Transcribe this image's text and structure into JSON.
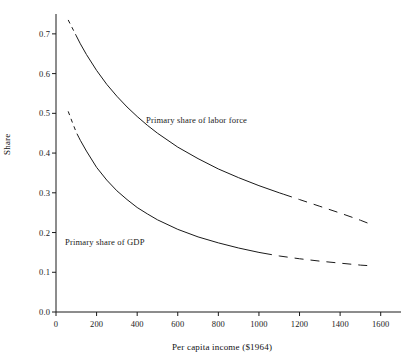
{
  "chart_data": {
    "type": "line",
    "title": "",
    "xlabel": "Per capita income ($1964)",
    "ylabel": "Share",
    "xlim": [
      0,
      1700
    ],
    "ylim": [
      0.0,
      0.75
    ],
    "grid": false,
    "legend_position": "inline-annotations",
    "xticks": [
      0,
      200,
      400,
      600,
      800,
      1000,
      1200,
      1400,
      1600
    ],
    "xtick_labels": [
      "0",
      "200",
      "400",
      "600",
      "800",
      "1000",
      "1200",
      "1400",
      "1600"
    ],
    "yticks": [
      0.0,
      0.1,
      0.2,
      0.3,
      0.4,
      0.5,
      0.6,
      0.7
    ],
    "ytick_labels": [
      "0.0",
      "0.1",
      "0.2",
      "0.3",
      "0.4",
      "0.5",
      "0.6",
      "0.7"
    ],
    "line_color": "#1a1a1a",
    "series": [
      {
        "name": "Primary share of labor force",
        "annotation": "Primary share of labor force",
        "style": "dashed-then-solid-then-dashed",
        "x": [
          60,
          80,
          100,
          120,
          150,
          200,
          250,
          300,
          350,
          400,
          450,
          500,
          600,
          700,
          800,
          900,
          1000,
          1100,
          1200,
          1300,
          1400,
          1500,
          1550
        ],
        "values": [
          0.735,
          0.715,
          0.695,
          0.675,
          0.648,
          0.608,
          0.573,
          0.543,
          0.516,
          0.492,
          0.47,
          0.45,
          0.415,
          0.386,
          0.36,
          0.338,
          0.318,
          0.3,
          0.283,
          0.266,
          0.249,
          0.231,
          0.221
        ],
        "solid_from": 100,
        "solid_to": 1120
      },
      {
        "name": "Primary share of GDP",
        "annotation": "Primary share of GDP",
        "style": "dashed-then-solid-then-dashed",
        "x": [
          60,
          80,
          100,
          120,
          150,
          200,
          250,
          300,
          350,
          400,
          450,
          500,
          600,
          700,
          800,
          900,
          1000,
          1100,
          1200,
          1300,
          1400,
          1500,
          1560
        ],
        "values": [
          0.505,
          0.478,
          0.452,
          0.432,
          0.405,
          0.364,
          0.332,
          0.305,
          0.283,
          0.263,
          0.247,
          0.232,
          0.208,
          0.189,
          0.174,
          0.161,
          0.15,
          0.141,
          0.134,
          0.128,
          0.123,
          0.118,
          0.116
        ],
        "solid_from": 112,
        "solid_to": 1020
      }
    ]
  },
  "annotations": {
    "labor_force": "Primary share of labor force",
    "gdp": "Primary share of GDP"
  },
  "axes": {
    "y_title": "Share",
    "x_title": "Per capita income ($1964)"
  }
}
